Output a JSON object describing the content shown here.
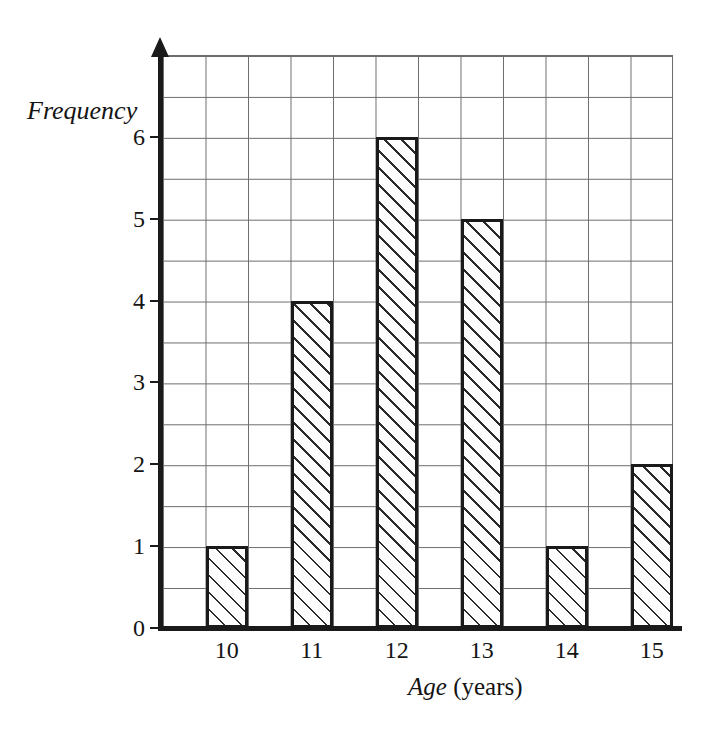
{
  "chart_data": {
    "type": "bar",
    "title": "",
    "subtitle": "",
    "xlabel": "Age (years)",
    "xlabel_italic_part": "Age",
    "xlabel_plain_part": " (years)",
    "ylabel": "Frequency",
    "categories": [
      "10",
      "11",
      "12",
      "13",
      "14",
      "15"
    ],
    "values": [
      1,
      4,
      6,
      5,
      1,
      2
    ],
    "series": [
      {
        "name": "Frequency",
        "values": [
          1,
          4,
          6,
          5,
          1,
          2
        ]
      }
    ],
    "ylim": [
      0,
      7.5
    ],
    "xlim": [
      9.5,
      16.5
    ],
    "y_ticks": [
      "0",
      "1",
      "2",
      "3",
      "4",
      "5",
      "6"
    ],
    "y_tick_values": [
      0,
      1,
      2,
      3,
      4,
      5,
      6
    ],
    "x_ticks": [
      "10",
      "11",
      "12",
      "13",
      "14",
      "15"
    ],
    "grid": true,
    "grid_minor_step_y": 0.5,
    "grid_minor_step_x": 0.5,
    "legend": null,
    "legend_position": "none",
    "bar_fill": "diagonal-hatch",
    "bar_outline_color": "#1a1a1a",
    "grid_color": "#6d6d6d",
    "axis_color": "#1a1a1a",
    "background_color": "#ffffff",
    "annotations": []
  },
  "axes": {
    "y_title": "Frequency",
    "x_title_italic": "Age",
    "x_title_plain": " (years)"
  },
  "y_tick_labels": [
    {
      "text": "0",
      "value": 0
    },
    {
      "text": "1",
      "value": 1
    },
    {
      "text": "2",
      "value": 2
    },
    {
      "text": "3",
      "value": 3
    },
    {
      "text": "4",
      "value": 4
    },
    {
      "text": "5",
      "value": 5
    },
    {
      "text": "6",
      "value": 6
    }
  ],
  "x_tick_labels": [
    {
      "text": "10",
      "value": 10
    },
    {
      "text": "11",
      "value": 11
    },
    {
      "text": "12",
      "value": 12
    },
    {
      "text": "13",
      "value": 13
    },
    {
      "text": "14",
      "value": 14
    },
    {
      "text": "15",
      "value": 15
    }
  ],
  "bars": [
    {
      "category": "10",
      "value": 1
    },
    {
      "category": "11",
      "value": 4
    },
    {
      "category": "12",
      "value": 6
    },
    {
      "category": "13",
      "value": 5
    },
    {
      "category": "14",
      "value": 1
    },
    {
      "category": "15",
      "value": 2
    }
  ]
}
